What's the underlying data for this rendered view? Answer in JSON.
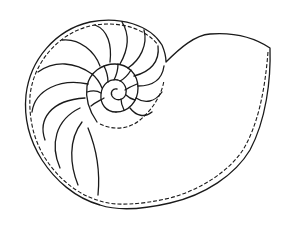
{
  "image": {
    "subject": "nautilus shell cross-section line drawing",
    "background": "#ffffff",
    "stroke_color": "#1a1a1a"
  }
}
